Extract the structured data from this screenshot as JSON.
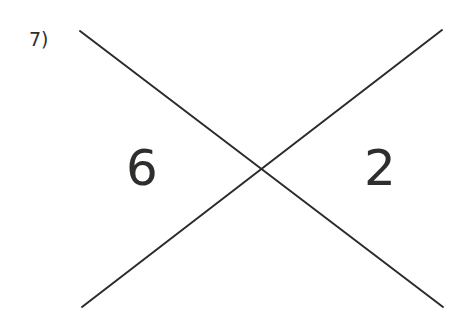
{
  "figure": {
    "background_color": "#ffffff",
    "width": 472,
    "height": 321,
    "problem_number": "7)",
    "line_color": "#2b2b2b",
    "line_width": 2,
    "text_color": "#2e2e2c",
    "labels": {
      "left_angle": "6",
      "right_angle": "2"
    },
    "lines": [
      {
        "name": "descending-line",
        "x1": 80,
        "y1": 31,
        "x2": 443,
        "y2": 307
      },
      {
        "name": "ascending-line",
        "x1": 82,
        "y1": 307,
        "x2": 442,
        "y2": 30
      }
    ],
    "intersection": {
      "x": 263,
      "y": 173
    }
  }
}
